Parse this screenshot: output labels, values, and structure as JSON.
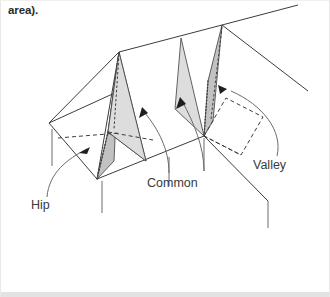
{
  "page": {
    "caption": "area).",
    "background_color": "#ffffff",
    "footer_rule_color": "#e3e3e3"
  },
  "figure": {
    "name": "roof-framing-diagram",
    "stroke_color": "#3c3c3c",
    "shade_dark": "#c2c2c2",
    "shade_light": "#dddddd",
    "labels": [
      {
        "id": "hip",
        "text": "Hip",
        "x": 30,
        "y": 204
      },
      {
        "id": "common",
        "text": "Common",
        "x": 146,
        "y": 182
      },
      {
        "id": "valley",
        "text": "Valley",
        "x": 252,
        "y": 164
      }
    ],
    "geometry": {
      "ridge_left_peak": [
        118,
        51
      ],
      "ridge_right_peak": [
        221,
        24
      ],
      "ridge_far_right": [
        297,
        4
      ],
      "left_gable_corner": [
        48,
        122
      ],
      "front_left_corner": [
        96,
        178
      ],
      "valley_junction": [
        203,
        135
      ],
      "eave_right_end": [
        267,
        200
      ],
      "hip_right_end": [
        307,
        90
      ]
    },
    "shaded_rafters": [
      {
        "id": "hip-rafter-shade",
        "tone": "dark"
      },
      {
        "id": "common-rafter-shade",
        "tone": "light"
      },
      {
        "id": "valley-common-shade",
        "tone": "light"
      },
      {
        "id": "valley-rafter-shade",
        "tone": "dark"
      }
    ],
    "arrows": [
      {
        "id": "hip-arrow",
        "points_to": "hip-rafter"
      },
      {
        "id": "common-arrow",
        "points_to": "common-rafter"
      },
      {
        "id": "common-arrow-mid",
        "points_to": "common-rafter-right"
      },
      {
        "id": "valley-arrow",
        "points_to": "valley-rafter"
      }
    ]
  }
}
